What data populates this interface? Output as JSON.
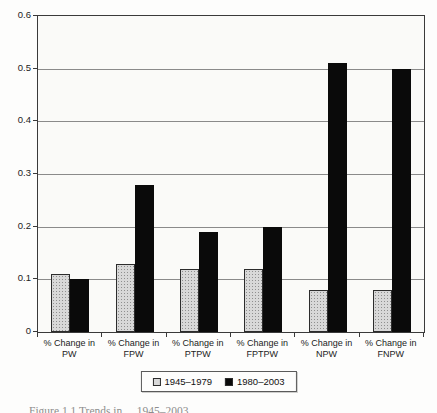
{
  "figure": {
    "caption_partial": "Figure 1.1 Trends in ... 1945–2003"
  },
  "layout": {
    "plot": {
      "left": 37,
      "top": 15,
      "width": 388,
      "height": 318
    }
  },
  "colors": {
    "series_1945_1979_fill": "#d8d8d8",
    "series_1980_2003_fill": "#0a0a0a",
    "gridline": "#8a8a8a",
    "frame": "#3a3a3a",
    "plot_background": "#fafaf8"
  },
  "chart_data": {
    "type": "bar",
    "title": "",
    "xlabel": "",
    "ylabel": "",
    "grid": true,
    "legend_position": "bottom",
    "ylim": [
      0,
      0.6
    ],
    "ytick_step": 0.1,
    "ytick_labels": [
      "0",
      "0.1",
      "0.2",
      "0.3",
      "0.4",
      "0.5",
      "0.6"
    ],
    "categories": [
      {
        "line1": "% Change in",
        "line2": "PW"
      },
      {
        "line1": "% Change in",
        "line2": "FPW"
      },
      {
        "line1": "% Change in",
        "line2": "PTPW"
      },
      {
        "line1": "% Change in",
        "line2": "FPTPW"
      },
      {
        "line1": "% Change in",
        "line2": "NPW"
      },
      {
        "line1": "% Change in",
        "line2": "FNPW"
      }
    ],
    "series": [
      {
        "name": "1945–1979",
        "swatch": "#d8d8d8",
        "values": [
          0.11,
          0.13,
          0.12,
          0.12,
          0.08,
          0.08
        ]
      },
      {
        "name": "1980–2003",
        "swatch": "#0a0a0a",
        "values": [
          0.1,
          0.28,
          0.19,
          0.2,
          0.51,
          0.5
        ]
      }
    ]
  }
}
